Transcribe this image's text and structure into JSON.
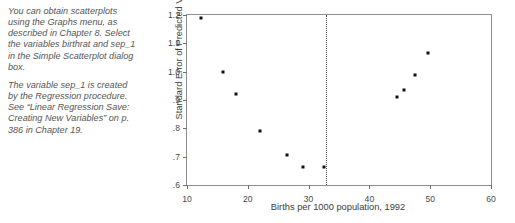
{
  "side_note": {
    "paragraphs": [
      "You can obtain scatterplots using the Graphs menu, as described in Chapter 8. Select the variables birthrat and sep_1 in the Simple Scatterplot dialog box.",
      "The variable sep_1 is created by the Regression procedure. See “Linear Regression Save: Creating New Variables” on p. 386 in Chapter 19."
    ]
  },
  "chart_data": {
    "type": "scatter",
    "title": "",
    "xlabel": "Births per 1000 population, 1992",
    "ylabel": "Standard Error of Predicted Value",
    "xlim": [
      10,
      60
    ],
    "ylim": [
      0.6,
      1.2
    ],
    "xticks": [
      10,
      20,
      30,
      40,
      50,
      60
    ],
    "xtick_labels": [
      "10",
      "20",
      "30",
      "40",
      "50",
      "60"
    ],
    "yticks": [
      0.6,
      0.7,
      0.8,
      0.9,
      1.0,
      1.1,
      1.2
    ],
    "ytick_labels": [
      ".6",
      ".7",
      ".8",
      ".9",
      "1.0",
      "1.1",
      "1.2"
    ],
    "grid": false,
    "legend": false,
    "marker_color": "#101010",
    "frame_color": "#8e8e8e",
    "annotations": [
      {
        "type": "vertical-dotted-line",
        "x": 32.8,
        "style": "dotted",
        "color": "#555555"
      }
    ],
    "points": [
      {
        "x": 12.3,
        "y": 1.19
      },
      {
        "x": 16.0,
        "y": 1.0
      },
      {
        "x": 18.0,
        "y": 0.92
      },
      {
        "x": 22.0,
        "y": 0.79
      },
      {
        "x": 26.5,
        "y": 0.705
      },
      {
        "x": 29.0,
        "y": 0.663
      },
      {
        "x": 32.5,
        "y": 0.663
      },
      {
        "x": 44.5,
        "y": 0.91
      },
      {
        "x": 45.7,
        "y": 0.935
      },
      {
        "x": 47.5,
        "y": 0.99
      },
      {
        "x": 49.6,
        "y": 1.065
      }
    ]
  }
}
